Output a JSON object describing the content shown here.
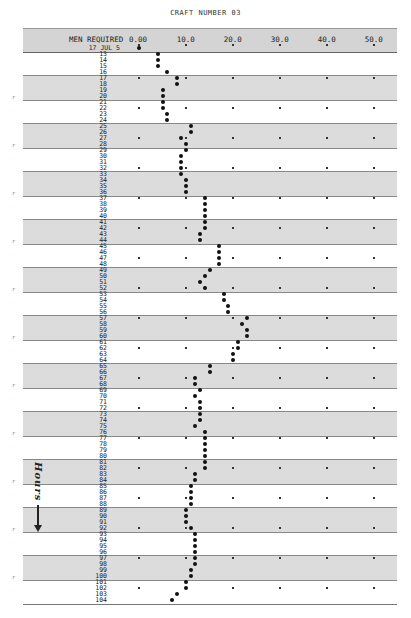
{
  "title": "CRAFT NUMBER 03",
  "header": {
    "label": "MEN REQUIRED",
    "ticks": [
      "0.00",
      "10.0",
      "20.0",
      "30.0",
      "40.0",
      "50.0"
    ]
  },
  "first_row_label": "17 JUL 5",
  "side_annotation": "Hours",
  "colors": {
    "band": "#dcdcdc",
    "header": "#d4d4d4",
    "dot": "#111111"
  },
  "chart_data": {
    "type": "scatter",
    "title": "CRAFT NUMBER 03",
    "xlabel": "MEN REQUIRED",
    "ylabel": "Hours",
    "xlim": [
      0,
      50
    ],
    "x_ticks": [
      0,
      10,
      20,
      30,
      40,
      50
    ],
    "x_tick_labels": [
      "0.00",
      "10.0",
      "20.0",
      "30.0",
      "40.0",
      "50.0"
    ],
    "start_label": "17 JUL 5",
    "hours": [
      12,
      13,
      14,
      15,
      16,
      17,
      18,
      19,
      20,
      21,
      22,
      23,
      24,
      25,
      26,
      27,
      28,
      29,
      30,
      31,
      32,
      33,
      34,
      35,
      36,
      37,
      38,
      39,
      40,
      41,
      42,
      43,
      44,
      45,
      46,
      47,
      48,
      49,
      50,
      51,
      52,
      53,
      54,
      55,
      56,
      57,
      58,
      59,
      60,
      61,
      62,
      63,
      64,
      65,
      66,
      67,
      68,
      69,
      70,
      71,
      72,
      73,
      74,
      75,
      76,
      77,
      78,
      79,
      80,
      81,
      82,
      83,
      84,
      85,
      86,
      87,
      88,
      89,
      90,
      91,
      92,
      93,
      94,
      95,
      96,
      97,
      98,
      99,
      100,
      101,
      102,
      103,
      104
    ],
    "men_required": [
      0,
      4,
      4,
      4,
      6,
      8,
      8,
      5,
      5,
      5,
      5,
      6,
      6,
      11,
      11,
      9,
      10,
      10,
      9,
      9,
      9,
      9,
      10,
      10,
      10,
      14,
      14,
      14,
      14,
      14,
      14,
      13,
      13,
      17,
      17,
      17,
      17,
      15,
      14,
      13,
      14,
      18,
      18,
      19,
      19,
      23,
      22,
      23,
      23,
      21,
      21,
      20,
      20,
      15,
      15,
      12,
      12,
      13,
      12,
      13,
      13,
      13,
      13,
      12,
      14,
      14,
      14,
      14,
      14,
      14,
      14,
      12,
      12,
      11,
      11,
      11,
      11,
      10,
      10,
      10,
      11,
      12,
      12,
      12,
      12,
      12,
      12,
      11,
      11,
      10,
      10,
      8,
      7
    ],
    "shaded_bands_hours": [
      [
        17,
        20
      ],
      [
        25,
        28
      ],
      [
        33,
        36
      ],
      [
        41,
        44
      ],
      [
        49,
        52
      ],
      [
        57,
        60
      ],
      [
        65,
        68
      ],
      [
        73,
        76
      ],
      [
        81,
        84
      ],
      [
        89,
        92
      ],
      [
        97,
        100
      ]
    ],
    "grid": true,
    "legend": null
  }
}
